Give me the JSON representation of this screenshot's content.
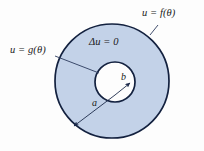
{
  "figure": {
    "name": "annulus-laplace-diagram",
    "background_color": "#fdfdfd",
    "annulus_fill": "#c3d2e8",
    "inner_fill": "#ffffff",
    "stroke_color": "#13213f",
    "leader_color": "#2b3a5c"
  },
  "labels": {
    "outer_boundary": "u = f(θ)",
    "inner_boundary": "u = g(θ)",
    "equation": "Δu = 0",
    "inner_radius": "b",
    "outer_radius": "a"
  },
  "geometry": {
    "outer_circle": {
      "cx": 112,
      "cy": 81,
      "r": 57
    },
    "inner_circle": {
      "cx": 115,
      "cy": 82,
      "r": 20
    },
    "radius_vertex": {
      "x": 115,
      "y": 95
    }
  }
}
